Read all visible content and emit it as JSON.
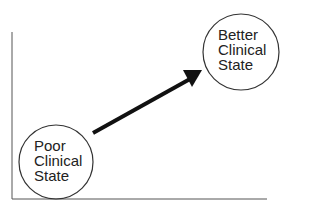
{
  "diagram": {
    "start_node": {
      "lines": [
        "Poor",
        "Clinical",
        "State"
      ]
    },
    "end_node": {
      "lines": [
        "Better",
        "Clinical",
        "State"
      ]
    },
    "arrow": {
      "from": "start_node",
      "to": "end_node"
    },
    "colors": {
      "stroke": "#1a1a1a",
      "axis": "#555555",
      "background": "#ffffff"
    }
  }
}
